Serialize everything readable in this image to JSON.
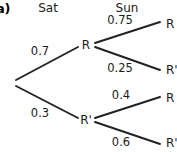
{
  "figure": {
    "part_label": "a)",
    "background_color": "#ffffff",
    "line_color": "#222222",
    "text_color": "#1a1a1a"
  },
  "headers": [
    {
      "label": "Sat",
      "x": 48,
      "y": 2
    },
    {
      "label": "Sun",
      "x": 127,
      "y": 2
    }
  ],
  "chart_data": {
    "type": "diagram",
    "diagram_type": "probability-tree",
    "title": "",
    "stages": [
      "Sat",
      "Sun"
    ],
    "outcomes": [
      "R",
      "R'"
    ],
    "root": {
      "x": 13,
      "y": 83
    },
    "nodes": [
      {
        "id": "stage1-R",
        "label": "R",
        "stage": "Sat",
        "x": 86,
        "y": 45
      },
      {
        "id": "stage1-R2",
        "label": "R'",
        "stage": "Sat",
        "x": 86,
        "y": 120
      }
    ],
    "leaves": [
      {
        "id": "leaf-RR",
        "label": "R",
        "x": 166,
        "y": 24
      },
      {
        "id": "leaf-RR2",
        "label": "R'",
        "x": 166,
        "y": 70
      },
      {
        "id": "leaf-R2R",
        "label": "R",
        "x": 166,
        "y": 98
      },
      {
        "id": "leaf-R2R2",
        "label": "R'",
        "x": 166,
        "y": 143
      }
    ],
    "branches": [
      {
        "id": "b-root-R",
        "from": "root",
        "to": "stage1-R",
        "probability": "0.7",
        "value": 0.7,
        "x1": 16,
        "y1": 80,
        "x2": 78,
        "y2": 47,
        "label_x": 40,
        "label_y": 52
      },
      {
        "id": "b-root-R2",
        "from": "root",
        "to": "stage1-R2",
        "probability": "0.3",
        "value": 0.3,
        "x1": 16,
        "y1": 86,
        "x2": 78,
        "y2": 118,
        "label_x": 40,
        "label_y": 114
      },
      {
        "id": "b-R-R",
        "from": "stage1-R",
        "to": "leaf-RR",
        "probability": "0.75",
        "value": 0.75,
        "x1": 95,
        "y1": 43,
        "x2": 160,
        "y2": 22,
        "label_x": 120,
        "label_y": 21
      },
      {
        "id": "b-R-R2",
        "from": "stage1-R",
        "to": "leaf-RR2",
        "probability": "0.25",
        "value": 0.25,
        "x1": 95,
        "y1": 47,
        "x2": 160,
        "y2": 70,
        "label_x": 120,
        "label_y": 69
      },
      {
        "id": "b-R2-R",
        "from": "stage1-R2",
        "to": "leaf-R2R",
        "probability": "0.4",
        "value": 0.4,
        "x1": 95,
        "y1": 118,
        "x2": 160,
        "y2": 97,
        "label_x": 121,
        "label_y": 96
      },
      {
        "id": "b-R2-R2",
        "from": "stage1-R2",
        "to": "leaf-R2R2",
        "probability": "0.6",
        "value": 0.6,
        "x1": 95,
        "y1": 122,
        "x2": 160,
        "y2": 144,
        "label_x": 121,
        "label_y": 143
      }
    ]
  }
}
